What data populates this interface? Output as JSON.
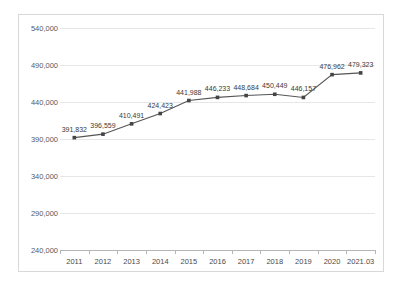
{
  "chart_data": {
    "type": "line",
    "title": "",
    "xlabel": "",
    "ylabel": "",
    "categories": [
      "2011",
      "2012",
      "2013",
      "2014",
      "2015",
      "2016",
      "2017",
      "2018",
      "2019",
      "2020",
      "2021.03"
    ],
    "values": [
      391832,
      396559,
      410491,
      424423,
      441988,
      446233,
      448684,
      450449,
      446157,
      476962,
      479323
    ],
    "point_labels": [
      "391,832",
      "396,559",
      "410,491",
      "424,423",
      "441,988",
      "446,233",
      "448,684",
      "450,449",
      "446,157",
      "476,962",
      "479,323"
    ],
    "ylim": [
      240000,
      540000
    ],
    "ytick_values": [
      240000,
      290000,
      340000,
      390000,
      440000,
      490000,
      540000
    ],
    "ytick_labels": [
      "240,000",
      "290,000",
      "340,000",
      "390,000",
      "440,000",
      "490,000",
      "540,000"
    ],
    "grid": true,
    "legend": false,
    "series_color": "#555555",
    "marker": "square",
    "marker_color": "#444444",
    "gridline_color": "#e6e6e6",
    "axis_color": "#b5b5b5",
    "background": "#ffffff"
  }
}
